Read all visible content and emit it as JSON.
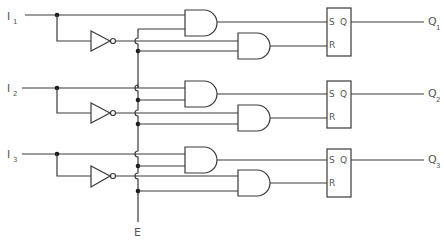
{
  "diagram": {
    "type": "logic-circuit",
    "enable_label": "E",
    "channels": [
      {
        "input_label": "I",
        "input_sub": "1",
        "output_label": "Q",
        "output_sub": "1",
        "flipflop": {
          "s_label": "S",
          "r_label": "R",
          "q_label": "Q"
        }
      },
      {
        "input_label": "I",
        "input_sub": "2",
        "output_label": "Q",
        "output_sub": "2",
        "flipflop": {
          "s_label": "S",
          "r_label": "R",
          "q_label": "Q"
        }
      },
      {
        "input_label": "I",
        "input_sub": "3",
        "output_label": "Q",
        "output_sub": "3",
        "flipflop": {
          "s_label": "S",
          "r_label": "R",
          "q_label": "Q"
        }
      }
    ],
    "colors": {
      "line": "#3a3a3a",
      "text": "#555555",
      "background": "#ffffff"
    }
  }
}
